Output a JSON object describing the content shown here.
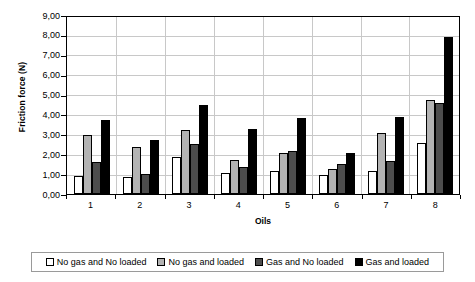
{
  "chart_data": {
    "type": "bar",
    "title": "",
    "xlabel": "Oils",
    "ylabel": "Friction force (N)",
    "categories": [
      "1",
      "2",
      "3",
      "4",
      "5",
      "6",
      "7",
      "8"
    ],
    "ylim": [
      0,
      9
    ],
    "ytick_step": 1,
    "ytick_labels": [
      "0,00",
      "1,00",
      "2,00",
      "3,00",
      "4,00",
      "5,00",
      "6,00",
      "7,00",
      "8,00",
      "9,00"
    ],
    "ytick_values": [
      0,
      1,
      2,
      3,
      4,
      5,
      6,
      7,
      8,
      9
    ],
    "grid": true,
    "legend_position": "bottom",
    "decimal_separator": ",",
    "series": [
      {
        "name": "No gas and No loaded",
        "color": "#ffffff",
        "values": [
          0.9,
          0.85,
          1.9,
          1.05,
          1.15,
          0.95,
          1.15,
          2.6
        ]
      },
      {
        "name": "No gas and loaded",
        "color": "#b3b3b3",
        "values": [
          3.0,
          2.4,
          3.25,
          1.75,
          2.1,
          1.3,
          3.1,
          4.8
        ]
      },
      {
        "name": "Gas and No loaded",
        "color": "#4d4d4d",
        "values": [
          1.65,
          1.0,
          2.55,
          1.4,
          2.2,
          1.55,
          1.7,
          4.65
        ]
      },
      {
        "name": "Gas and loaded",
        "color": "#000000",
        "values": [
          3.8,
          2.75,
          4.55,
          3.3,
          3.9,
          2.1,
          3.95,
          8.0
        ]
      }
    ]
  }
}
